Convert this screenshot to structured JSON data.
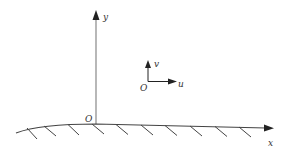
{
  "diagram": {
    "axes": {
      "x_label": "x",
      "y_label": "y",
      "origin_label": "O"
    },
    "inset": {
      "origin_label": "O",
      "horizontal_label": "u",
      "vertical_label": "v"
    },
    "colors": {
      "axis": "#888888",
      "wall": "#444444",
      "text": "#333333"
    }
  }
}
